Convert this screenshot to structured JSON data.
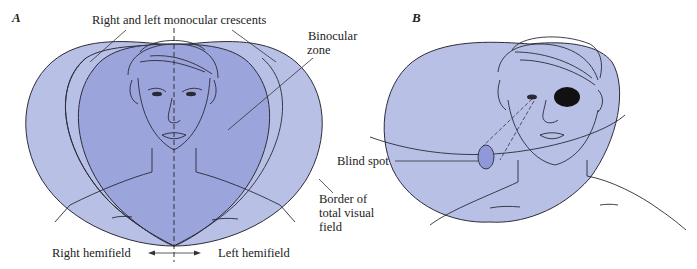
{
  "colors": {
    "field_light": "#b9c0e6",
    "field_binocular": "#9ca4dc",
    "blind_spot": "#8f98d9",
    "outline": "#2d2d3a",
    "eye_patch": "#111111"
  },
  "panel_a": {
    "label": "A",
    "top_label": "Right and left monocular crescents",
    "binocular_label_line1": "Binocular",
    "binocular_label_line2": "zone",
    "border_label_line1": "Border of",
    "border_label_line2": "total visual",
    "border_label_line3": "field",
    "right_hemifield": "Right hemifield",
    "left_hemifield": "Left hemifield"
  },
  "panel_b": {
    "label": "B",
    "blind_spot_label": "Blind spot"
  }
}
